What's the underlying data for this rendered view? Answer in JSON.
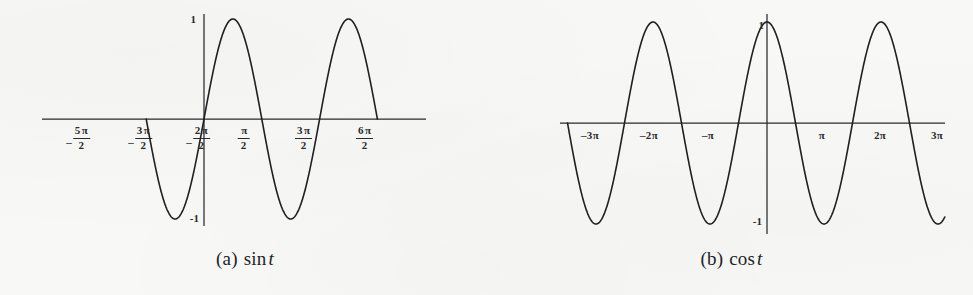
{
  "figure": {
    "background_color": "#f8f8f6",
    "ink_color": "#1f1f24"
  },
  "panels": [
    {
      "id": "a",
      "caption_label": "(a)",
      "caption_function": "sin",
      "caption_variable": "t"
    },
    {
      "id": "b",
      "caption_label": "(b)",
      "caption_function": "cos",
      "caption_variable": "t"
    }
  ],
  "panel_a": {
    "y_top_label": "1",
    "y_bottom_label": "-1",
    "x_tick_labels": [
      {
        "sign": "–",
        "numerator": "5",
        "denominator": "2",
        "pi": "π"
      },
      {
        "sign": "–",
        "numerator": "3",
        "denominator": "2",
        "pi": "π"
      },
      {
        "sign": "–",
        "numerator": "2",
        "denominator": "2",
        "pi": "π"
      },
      {
        "sign": "",
        "numerator": "",
        "denominator": "2",
        "pi": "π"
      },
      {
        "sign": "",
        "numerator": "3",
        "denominator": "2",
        "pi": "π"
      },
      {
        "sign": "",
        "numerator": "6",
        "denominator": "2",
        "pi": "π"
      }
    ]
  },
  "panel_b": {
    "y_top_label": "1",
    "y_bottom_label": "-1",
    "x_tick_labels": [
      "–3π",
      "–2π",
      "–π",
      "π",
      "2π",
      "3π"
    ]
  },
  "chart_data": [
    {
      "type": "line",
      "panel": "a",
      "title": "(a) sin t",
      "function": "sin(t)",
      "xlabel": "t",
      "ylabel": "",
      "xlim": [
        -3.141592653589793,
        9.42477796076938
      ],
      "ylim": [
        -1.15,
        1.15
      ],
      "grid": false,
      "legend": "none",
      "amplitude": 1,
      "period": 6.283185307179586,
      "x_tick_values": [
        -7.853981633974483,
        -4.71238898038469,
        -1.5707963267948966,
        1.5707963267948966,
        4.71238898038469,
        7.853981633974483
      ],
      "x_tick_text": [
        "-5π/2",
        "-3π/2",
        "-2π/2",
        "π/2",
        "3π/2",
        "6π/2"
      ],
      "y_tick_values": [
        1,
        -1
      ],
      "y_tick_text": [
        "1",
        "-1"
      ],
      "maxima_at": [
        -7.853981633974483,
        -1.5707963267948966,
        4.71238898038469
      ],
      "minima_at": [
        -4.71238898038469,
        1.5707963267948966,
        7.853981633974483
      ],
      "zeros_at": [
        -9.42477796076938,
        -6.283185307179586,
        -3.141592653589793,
        0,
        3.141592653589793,
        6.283185307179586,
        9.42477796076938
      ],
      "series": [
        {
          "name": "sin t",
          "x": [
            -10.21,
            -9.42,
            -8.64,
            -7.85,
            -7.07,
            -6.28,
            -5.5,
            -4.71,
            -3.93,
            -3.14,
            -2.36,
            -1.57,
            -0.79,
            0.0,
            0.79,
            1.57,
            2.36,
            3.14,
            3.93,
            4.71,
            5.5,
            6.28,
            7.07,
            7.85,
            8.64,
            9.42,
            10.21
          ],
          "values": [
            0.707,
            0.0,
            -0.707,
            -1.0,
            -0.707,
            0.0,
            0.707,
            1.0,
            0.707,
            0.0,
            -0.707,
            -1.0,
            -0.707,
            0.0,
            0.707,
            1.0,
            0.707,
            0.0,
            -0.707,
            -1.0,
            -0.707,
            0.0,
            0.707,
            1.0,
            0.707,
            0.0,
            -0.707
          ]
        }
      ]
    },
    {
      "type": "line",
      "panel": "b",
      "title": "(b) cos t",
      "function": "cos(t)",
      "xlabel": "t",
      "ylabel": "",
      "xlim": [
        -10.99557428756428,
        10.99557428756428
      ],
      "ylim": [
        -1.15,
        1.15
      ],
      "grid": false,
      "legend": "none",
      "amplitude": 1,
      "period": 6.283185307179586,
      "x_tick_values": [
        -9.42477796076938,
        -6.283185307179586,
        -3.141592653589793,
        3.141592653589793,
        6.283185307179586,
        9.42477796076938
      ],
      "x_tick_text": [
        "-3π",
        "-2π",
        "-π",
        "π",
        "2π",
        "3π"
      ],
      "y_tick_values": [
        1,
        -1
      ],
      "y_tick_text": [
        "1",
        "-1"
      ],
      "maxima_at": [
        -6.283185307179586,
        0,
        6.283185307179586
      ],
      "minima_at": [
        -9.42477796076938,
        -3.141592653589793,
        3.141592653589793,
        9.42477796076938
      ],
      "zeros_at": [
        -7.853981633974483,
        -4.71238898038469,
        -1.5707963267948966,
        1.5707963267948966,
        4.71238898038469,
        7.853981633974483
      ],
      "series": [
        {
          "name": "cos t",
          "x": [
            -10.99,
            -10.21,
            -9.42,
            -8.64,
            -7.85,
            -7.07,
            -6.28,
            -5.5,
            -4.71,
            -3.93,
            -3.14,
            -2.36,
            -1.57,
            -0.79,
            0.0,
            0.79,
            1.57,
            2.36,
            3.14,
            3.93,
            4.71,
            5.5,
            6.28,
            7.07,
            7.85,
            8.64,
            9.42,
            10.21,
            10.99
          ],
          "values": [
            -0.707,
            -1.0,
            -0.707,
            0.0,
            0.707,
            1.0,
            0.707,
            0.0,
            -0.707,
            -1.0,
            -0.707,
            0.0,
            0.707,
            1.0,
            0.707,
            0.0,
            -0.707,
            -1.0,
            -0.707,
            0.0,
            0.707,
            1.0,
            0.707,
            0.0,
            -0.707,
            -1.0,
            -0.707,
            0.0,
            0.707
          ]
        }
      ]
    }
  ]
}
